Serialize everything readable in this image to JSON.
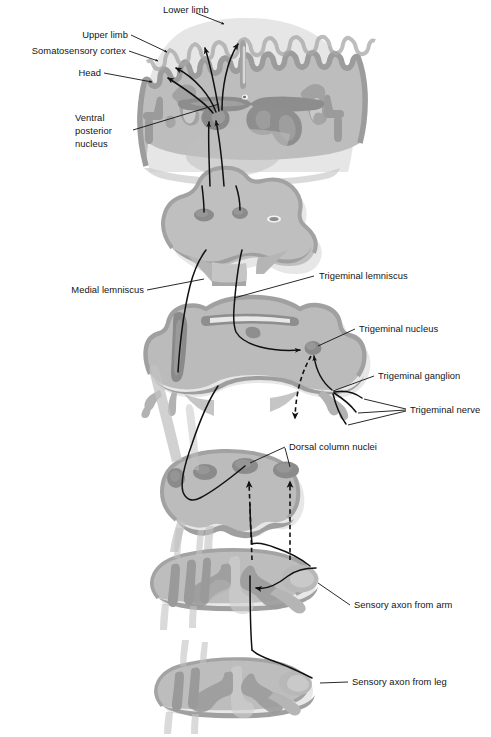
{
  "figure": {
    "background": "#ffffff",
    "ink": "#111111",
    "palette": {
      "tissue_light": "#c3c3c3",
      "tissue_mid": "#b0b0b0",
      "tissue_dark": "#8e8e8e",
      "nucleus_dark": "#757575",
      "shadow": "#d2d2d2",
      "outline": "#9a9a9a",
      "white_matter": "#dcdcdc"
    }
  },
  "labels": {
    "lower_limb": "Lower limb",
    "upper_limb": "Upper limb",
    "somatosensory_cortex": "Somatosensory cortex",
    "head": "Head",
    "ventral_posterior_nucleus_line1": "Ventral",
    "ventral_posterior_nucleus_line2": "posterior",
    "ventral_posterior_nucleus_line3": "nucleus",
    "medial_lemniscus": "Medial lemniscus",
    "trigeminal_lemniscus": "Trigeminal lemniscus",
    "trigeminal_nucleus": "Trigeminal nucleus",
    "trigeminal_ganglion": "Trigeminal ganglion",
    "trigeminal_nerve": "Trigeminal nerve",
    "dorsal_column_nuclei": "Dorsal column nuclei",
    "sensory_axon_from_arm": "Sensory axon from arm",
    "sensory_axon_from_leg": "Sensory axon from leg"
  },
  "sections": [
    {
      "id": "forebrain",
      "name": "Coronal forebrain section with thalamus and cerebral cortex"
    },
    {
      "id": "midbrain",
      "name": "Midbrain cross section"
    },
    {
      "id": "pons",
      "name": "Pons and rostral medulla cross section"
    },
    {
      "id": "medulla",
      "name": "Caudal medulla cross section with dorsal column nuclei"
    },
    {
      "id": "cord-cervical",
      "name": "Cervical spinal cord cross section with dorsal root ganglion"
    },
    {
      "id": "cord-lumbar",
      "name": "Lumbar spinal cord cross section with dorsal root ganglion"
    }
  ]
}
